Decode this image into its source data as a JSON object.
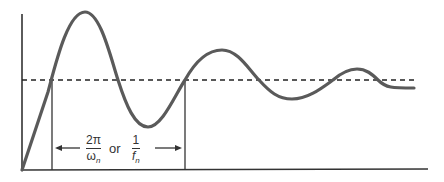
{
  "diagram": {
    "colors": {
      "curve": "#5a5a5a",
      "axis": "#333333",
      "dashed": "#222222",
      "background": "#ffffff"
    },
    "label": {
      "frac1_num": "2π",
      "frac1_den": "ω",
      "frac1_den_sub": "n",
      "or_text": "or",
      "frac2_num": "1",
      "frac2_den": "f",
      "frac2_den_sub": "n"
    },
    "markers": {
      "start_x": 52,
      "end_x": 185
    },
    "setpoint_y": 80
  }
}
